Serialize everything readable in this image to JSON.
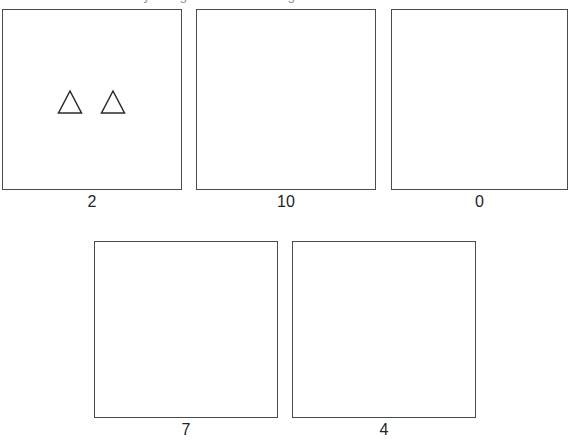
{
  "prompt": {
    "text": "How many triangles are in the image?",
    "clipped": true
  },
  "question": {
    "shape_name": "triangle",
    "shape_count": 2,
    "shape_color": "#2b2b2b"
  },
  "options": [
    {
      "label": "2",
      "name": "option-2",
      "x": 2,
      "y": 9,
      "width": 180,
      "height": 181,
      "label_y": 193,
      "shapes": [
        {
          "name": "triangle-shape",
          "x": 54,
          "y": 79,
          "size": 26
        },
        {
          "name": "triangle-shape",
          "x": 97,
          "y": 79,
          "size": 26
        }
      ]
    },
    {
      "label": "10",
      "name": "option-10",
      "x": 196,
      "y": 9,
      "width": 180,
      "height": 181,
      "label_y": 193,
      "shapes": []
    },
    {
      "label": "0",
      "name": "option-0",
      "x": 391,
      "y": 9,
      "width": 177,
      "height": 181,
      "label_y": 193,
      "shapes": []
    },
    {
      "label": "7",
      "name": "option-7",
      "x": 94,
      "y": 241,
      "width": 184,
      "height": 177,
      "label_y": 421,
      "shapes": []
    },
    {
      "label": "4",
      "name": "option-4",
      "x": 292,
      "y": 241,
      "width": 184,
      "height": 177,
      "label_y": 421,
      "shapes": []
    }
  ]
}
